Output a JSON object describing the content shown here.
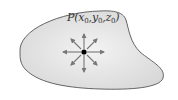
{
  "diagram": {
    "type": "region-with-point",
    "point_label": {
      "name": "P",
      "open": "(",
      "x": "x",
      "y": "y",
      "z": "z",
      "subscript": "0",
      "sep": ",",
      "close": ")"
    },
    "arrows": {
      "count": 8,
      "directions": [
        "up",
        "up-right",
        "right",
        "down-right",
        "down",
        "down-left",
        "left",
        "up-left"
      ]
    },
    "colors": {
      "region_fill": "#e4e4e4",
      "region_stroke": "#555555",
      "arrow": "#777777",
      "point": "#000000",
      "label": "#333333"
    }
  }
}
